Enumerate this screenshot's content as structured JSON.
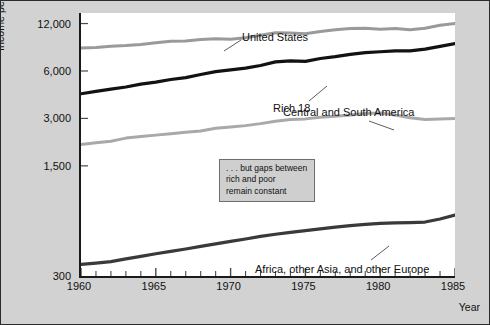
{
  "chart_data": {
    "type": "line",
    "title": "",
    "xlabel": "Year",
    "ylabel": "Income per person (1980 dollars, ratio scale)",
    "yscale": "log",
    "ylim": [
      300,
      14000
    ],
    "xlim": [
      1960,
      1985
    ],
    "grid": false,
    "legend_position": "inline-labels",
    "ytick_labels": [
      "12,000",
      "6,000",
      "3,000",
      "1,500",
      "300"
    ],
    "ytick_values": [
      12000,
      6000,
      3000,
      1500,
      300
    ],
    "xtick_labels": [
      "1960",
      "1965",
      "1970",
      "1975",
      "1980",
      "1985"
    ],
    "xtick_values": [
      1960,
      1965,
      1970,
      1975,
      1980,
      1985
    ],
    "x": [
      1960,
      1961,
      1962,
      1963,
      1964,
      1965,
      1966,
      1967,
      1968,
      1969,
      1970,
      1971,
      1972,
      1973,
      1974,
      1975,
      1976,
      1977,
      1978,
      1979,
      1980,
      1981,
      1982,
      1983,
      1984,
      1985
    ],
    "series": [
      {
        "name": "United States",
        "color": "#9a9a9a",
        "width": 3.0,
        "label_x": 163,
        "label_y": 18,
        "leader": [
          [
            160,
            27
          ],
          [
            143,
            38
          ]
        ],
        "values": [
          8400,
          8450,
          8600,
          8700,
          8850,
          9050,
          9250,
          9300,
          9500,
          9600,
          9550,
          9750,
          10100,
          10500,
          10450,
          10350,
          10700,
          10950,
          11150,
          11200,
          11050,
          11150,
          10950,
          11200,
          11700,
          12000
        ]
      },
      {
        "name": "Rich 18",
        "color": "#121212",
        "width": 3.2,
        "label_x": 194,
        "label_y": 89,
        "leader": [
          [
            228,
            88
          ],
          [
            246,
            73
          ]
        ],
        "values": [
          4300,
          4450,
          4600,
          4750,
          4950,
          5100,
          5300,
          5450,
          5700,
          5950,
          6100,
          6250,
          6500,
          6850,
          6950,
          6900,
          7200,
          7400,
          7650,
          7850,
          7950,
          8050,
          8050,
          8250,
          8600,
          8950
        ]
      },
      {
        "name": "Central and South America",
        "color": "#a9a9a9",
        "width": 3.0,
        "label_x": 204,
        "label_y": 93,
        "leader": [
          [
            288,
            108
          ],
          [
            313,
            117
          ]
        ],
        "values": [
          2050,
          2100,
          2150,
          2250,
          2300,
          2350,
          2400,
          2450,
          2500,
          2600,
          2650,
          2700,
          2780,
          2880,
          2950,
          2980,
          3050,
          3100,
          3150,
          3220,
          3250,
          3150,
          3030,
          2950,
          2980,
          3000
        ]
      },
      {
        "name": "Africa, other Asia, and other Europe",
        "color": "#3a3a3a",
        "width": 3.2,
        "label_x": 176,
        "label_y": 250,
        "leader": [
          [
            290,
            247
          ],
          [
            308,
            233
          ]
        ],
        "values": [
          355,
          362,
          370,
          385,
          400,
          415,
          430,
          445,
          462,
          480,
          497,
          515,
          535,
          552,
          568,
          582,
          598,
          612,
          626,
          638,
          648,
          652,
          655,
          660,
          690,
          730
        ]
      }
    ],
    "annotation": {
      "lines": [
        ". . . but gaps between",
        "rich and poor",
        "remain constant"
      ]
    }
  }
}
